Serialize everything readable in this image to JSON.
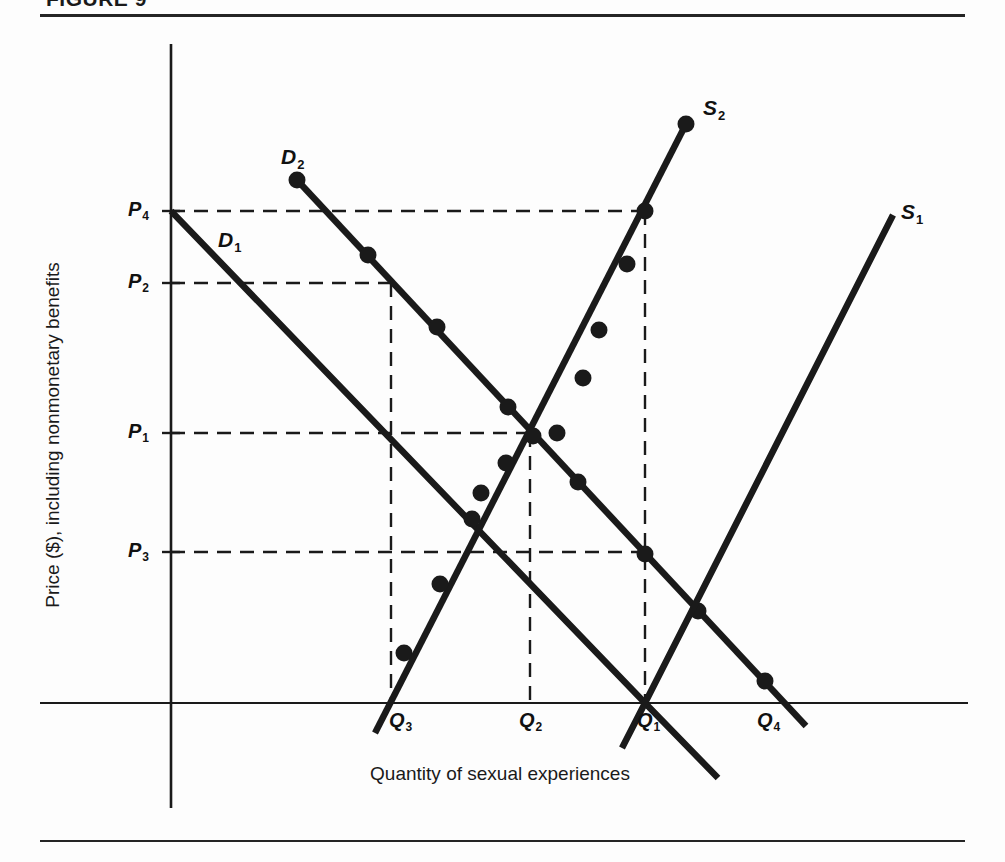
{
  "figure": {
    "title": "FIGURE 9",
    "background_color": "#fdfdfd",
    "line_color": "#1a1a1a"
  },
  "axes": {
    "y_title": "Price ($), including nonmonetary benefits",
    "x_title": "Quantity of sexual experiences",
    "y_ticks": [
      {
        "label": "P",
        "sub": "4"
      },
      {
        "label": "P",
        "sub": "2"
      },
      {
        "label": "P",
        "sub": "1"
      },
      {
        "label": "P",
        "sub": "3"
      }
    ],
    "x_ticks": [
      {
        "label": "Q",
        "sub": "3"
      },
      {
        "label": "Q",
        "sub": "2"
      },
      {
        "label": "Q",
        "sub": "1"
      },
      {
        "label": "Q",
        "sub": "4"
      }
    ]
  },
  "curve_labels": [
    {
      "label": "D",
      "sub": "1"
    },
    {
      "label": "D",
      "sub": "2"
    },
    {
      "label": "S",
      "sub": "1"
    },
    {
      "label": "S",
      "sub": "2"
    }
  ],
  "chart_data": {
    "type": "line",
    "title": "FIGURE 9",
    "xlabel": "Quantity of sexual experiences",
    "ylabel": "Price ($), including nonmonetary benefits",
    "grid": false,
    "legend": "inline-curve-labels",
    "axis_origin_px": {
      "x": 171,
      "y": 703
    },
    "xlim_px": [
      171,
      968
    ],
    "ylim_px": [
      44,
      703
    ],
    "price_levels": [
      {
        "name": "P4",
        "y_px": 211
      },
      {
        "name": "P2",
        "y_px": 283
      },
      {
        "name": "P1",
        "y_px": 433
      },
      {
        "name": "P3",
        "y_px": 552
      }
    ],
    "quantity_levels": [
      {
        "name": "Q3",
        "x_px": 391
      },
      {
        "name": "Q2",
        "x_px": 530
      },
      {
        "name": "Q1",
        "x_px": 645
      },
      {
        "name": "Q4",
        "x_px": 770
      }
    ],
    "series": [
      {
        "name": "D1",
        "kind": "demand",
        "slope": "downward",
        "points_px": [
          [
            171,
            211
          ],
          [
            645,
            703
          ],
          [
            718,
            778
          ]
        ],
        "markers_px": []
      },
      {
        "name": "D2",
        "kind": "demand",
        "slope": "downward",
        "points_px": [
          [
            297,
            180
          ],
          [
            806,
            726
          ]
        ],
        "markers_px": [
          [
            297,
            180
          ],
          [
            368,
            255
          ],
          [
            437,
            327
          ],
          [
            508,
            407
          ],
          [
            578,
            482
          ],
          [
            645,
            554
          ],
          [
            698,
            611
          ],
          [
            765,
            681
          ]
        ]
      },
      {
        "name": "S1",
        "kind": "supply",
        "slope": "upward",
        "points_px": [
          [
            893,
            215
          ],
          [
            645,
            703
          ],
          [
            622,
            748
          ]
        ],
        "markers_px": []
      },
      {
        "name": "S2",
        "kind": "supply",
        "slope": "upward",
        "points_px": [
          [
            686,
            124
          ],
          [
            375,
            733
          ]
        ],
        "markers_px": [
          [
            686,
            124
          ],
          [
            645,
            211
          ],
          [
            627,
            264
          ],
          [
            599,
            330
          ],
          [
            583,
            378
          ],
          [
            557,
            433
          ],
          [
            533,
            436
          ],
          [
            506,
            463
          ],
          [
            481,
            493
          ],
          [
            472,
            519
          ],
          [
            440,
            584
          ],
          [
            404,
            653
          ]
        ]
      }
    ],
    "equilibria": [
      {
        "name": "D1 x S1",
        "price": "P-zero",
        "quantity": "Q1",
        "px": [
          645,
          703
        ]
      },
      {
        "name": "D2 x S2",
        "price": "P1",
        "quantity": "Q2",
        "px": [
          530,
          433
        ]
      },
      {
        "name": "D1 x S2",
        "price": "P2",
        "quantity": "Q3",
        "px": [
          391,
          283
        ]
      },
      {
        "name": "D2 x S1",
        "price": "P3",
        "quantity": "Q4_ref",
        "px": [
          645,
          552
        ]
      }
    ],
    "dashed_guides_px": [
      {
        "from": [
          171,
          211
        ],
        "to": [
          645,
          211
        ],
        "kind": "horizontal",
        "level": "P4"
      },
      {
        "from": [
          171,
          283
        ],
        "to": [
          391,
          283
        ],
        "kind": "horizontal",
        "level": "P2"
      },
      {
        "from": [
          171,
          433
        ],
        "to": [
          530,
          433
        ],
        "kind": "horizontal",
        "level": "P1"
      },
      {
        "from": [
          171,
          552
        ],
        "to": [
          645,
          552
        ],
        "kind": "horizontal",
        "level": "P3"
      },
      {
        "from": [
          391,
          283
        ],
        "to": [
          391,
          703
        ],
        "kind": "vertical",
        "at": "Q3"
      },
      {
        "from": [
          530,
          433
        ],
        "to": [
          530,
          703
        ],
        "kind": "vertical",
        "at": "Q2"
      },
      {
        "from": [
          645,
          211
        ],
        "to": [
          645,
          703
        ],
        "kind": "vertical",
        "at": "Q1"
      }
    ]
  }
}
